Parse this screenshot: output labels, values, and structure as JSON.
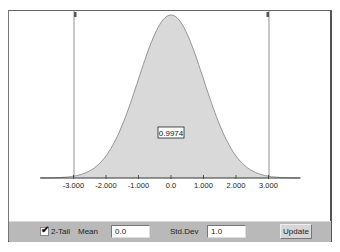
{
  "chart_data": {
    "type": "area",
    "title": "",
    "distribution": "normal",
    "mean": 0.0,
    "std_dev": 1.0,
    "two_tail": true,
    "bounds": [
      -3.0,
      3.0
    ],
    "shaded_area_value": "0.9974",
    "x_ticks": [
      -3.0,
      -2.0,
      -1.0,
      0.0,
      1.0,
      2.0,
      3.0
    ],
    "x_tick_labels": [
      "-3.000",
      "-2.000",
      "-1.000",
      "0.0",
      "1.000",
      "2.000",
      "3.000"
    ],
    "xlabel": "",
    "ylabel": "",
    "grid": false,
    "legend": "none"
  },
  "plot": {
    "area_label": "0.9974",
    "ticks": [
      "-3.000",
      "-2.000",
      "-1.000",
      "0.0",
      "1.000",
      "2.000",
      "3.000"
    ]
  },
  "toolbar": {
    "two_tail_label": "2-Tail",
    "two_tail_checked": true,
    "check_glyph": "✔",
    "mean_label": "Mean",
    "mean_value": "0.0",
    "std_dev_label": "Std.Dev",
    "std_dev_value": "1.0",
    "update_label": "Update"
  },
  "colors": {
    "fill": "#d9d9d9",
    "curve": "#8a8a8a",
    "axis": "#333333",
    "toolbar_bg": "#b9b9b9"
  }
}
